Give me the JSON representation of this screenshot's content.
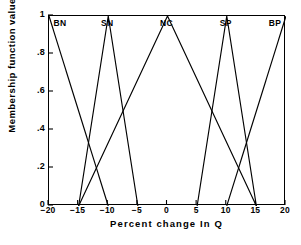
{
  "chart_data": {
    "type": "line",
    "title": "",
    "xlabel": "Percent change In Q",
    "ylabel": "Membership function value",
    "xlim": [
      -20,
      20
    ],
    "ylim": [
      0,
      1
    ],
    "grid": false,
    "legend_position": "inside-top",
    "x_ticks": [
      {
        "value": -20,
        "label": "−20"
      },
      {
        "value": -15,
        "label": "−15"
      },
      {
        "value": -10,
        "label": "−10"
      },
      {
        "value": -5,
        "label": "−5"
      },
      {
        "value": 0,
        "label": "0"
      },
      {
        "value": 5,
        "label": "5"
      },
      {
        "value": 10,
        "label": "10"
      },
      {
        "value": 15,
        "label": "15"
      },
      {
        "value": 20,
        "label": "20"
      }
    ],
    "y_ticks": [
      {
        "value": 0,
        "label": "0"
      },
      {
        "value": 0.2,
        "label": ".2"
      },
      {
        "value": 0.4,
        "label": ".4"
      },
      {
        "value": 0.6,
        "label": ".6"
      },
      {
        "value": 0.8,
        "label": ".8"
      },
      {
        "value": 1,
        "label": "1"
      }
    ],
    "line_color": "#000000",
    "series": [
      {
        "name": "BN",
        "label_x": -19.0,
        "x": [
          -20,
          -10
        ],
        "values": [
          1,
          0
        ]
      },
      {
        "name": "SN",
        "label_x": -10.0,
        "x": [
          -15,
          -10,
          -5
        ],
        "values": [
          0,
          1,
          0
        ]
      },
      {
        "name": "NC",
        "label_x": 0.0,
        "x": [
          -15,
          0,
          15
        ],
        "values": [
          0,
          1,
          0
        ]
      },
      {
        "name": "SP",
        "label_x": 10.0,
        "x": [
          5,
          10,
          15
        ],
        "values": [
          0,
          1,
          0
        ]
      },
      {
        "name": "BP",
        "label_x": 19.0,
        "x": [
          10,
          20
        ],
        "values": [
          0,
          1
        ]
      }
    ]
  }
}
